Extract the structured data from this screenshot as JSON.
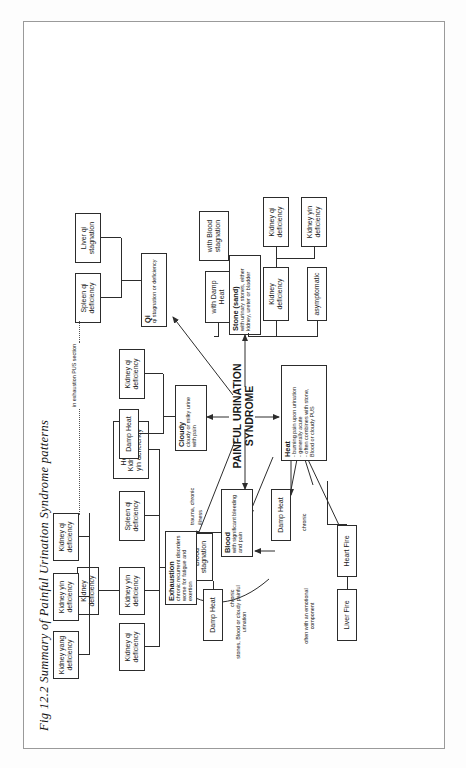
{
  "figure": {
    "caption": "Fig 12.2 Summary of Painful Urination Syndrome patterns",
    "center": {
      "line1": "PAINFUL URINATION",
      "line2": "SYNDROME"
    }
  },
  "main_categories": {
    "heat": {
      "title": "Heat",
      "b1": "- burning pain upon urination",
      "b2": "- generally acute",
      "b3": "- often combines with stone,",
      "b4": "  Blood or cloudy PUS"
    },
    "blood": {
      "title": "Blood",
      "sub1": "with significant bleeding",
      "sub2": "and pain"
    },
    "exhaustion": {
      "title": "Exhaustion",
      "sub1": "chronic recurrent disorders",
      "sub2": "worse for fatigue and exertion"
    },
    "cloudy": {
      "title": "Cloudy",
      "sub1": "cloudy or milky urine",
      "sub2": "with pain"
    },
    "qi": {
      "title": "Qi",
      "sub1": "qi stagnation or deficiency"
    },
    "stone": {
      "title": "Stone (sand)",
      "sub1": "with urinary stones, either",
      "sub2": "kidney, ureter or bladder"
    }
  },
  "heat_branch": {
    "causes": [
      "Liver Fire",
      "Heart Fire",
      "Damp Heat"
    ],
    "note_emotional": "often with an emotional component",
    "note_stones": "stones, Blood or cloudy painful urination",
    "edge_chronic": "chronic"
  },
  "blood_branch": {
    "damp_heat": "Damp Heat",
    "stagnation": "Blood stagnation",
    "trauma_note_1": "trauma, chronic",
    "trauma_note_2": "illness",
    "edge_chronic": "chronic"
  },
  "exhaustion_branch": {
    "kidney_qi": "Kidney qi deficiency",
    "kidney_yin": "Kidney yin deficiency",
    "kidney_def": "Kidney deficiency",
    "kidney_yang": "Kidney yang deficiency",
    "spleen_qi": "Spleen qi deficiency",
    "heart_kidney": "Heart and Kidney qi and yin deficiency"
  },
  "cloudy_branch": {
    "damp_heat": "Damp Heat",
    "kidney_qi": "Kidney qi deficiency"
  },
  "qi_branch": {
    "spleen_qi": "Spleen qi deficiency",
    "liver_qi": "Liver qi stagnation",
    "note": "in exhaustion PUS section"
  },
  "stone_branch": {
    "asymptomatic": "asymptomatic",
    "kidney_def": "Kidney deficiency",
    "with_damp_heat": "with Damp Heat",
    "with_blood": "with Blood stagnation",
    "kidney_qi": "Kidney qi deficiency",
    "kidney_yin": "Kidney yin deficiency"
  },
  "colors": {
    "ink": "#2c2c2c",
    "frame": "#9a9a9a",
    "paper": "#ffffff"
  }
}
